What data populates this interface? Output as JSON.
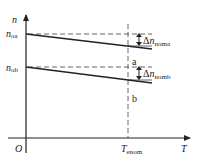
{
  "diagram": {
    "type": "speed-torque characteristic",
    "axes": {
      "y_label": "n",
      "x_label": "T",
      "origin_label": "O"
    },
    "y_ticks": [
      {
        "base": "n",
        "sub": "oa"
      },
      {
        "base": "n",
        "sub": "ob"
      }
    ],
    "x_ticks": [
      {
        "base": "T",
        "sub": "enom"
      }
    ],
    "points": [
      {
        "label": "a"
      },
      {
        "label": "b"
      }
    ],
    "deltas": [
      {
        "prefix": "Δ",
        "base": "n",
        "sub": "noma"
      },
      {
        "prefix": "Δ",
        "base": "n",
        "sub": "nomb"
      }
    ],
    "colors": {
      "line": "#222222",
      "dash": "#555555"
    }
  }
}
